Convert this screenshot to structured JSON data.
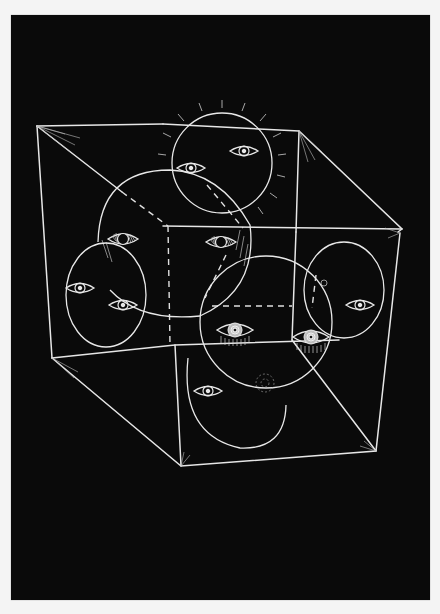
{
  "artwork": {
    "title": "Cube of Eyes",
    "medium": "white ink on black paper",
    "colors": {
      "background": "#f4f4f4",
      "paper": "#0a0a0a",
      "ink": "#e8e8e8"
    },
    "subject": {
      "cube": "wireframe cube in perspective with radiating hatch marks at vertices",
      "spheres": [
        {
          "name": "top-sphere",
          "eyes": 2,
          "rays": true
        },
        {
          "name": "upper-left-sphere",
          "eyes": 2
        },
        {
          "name": "left-sphere",
          "eyes": 2
        },
        {
          "name": "center-sphere",
          "eyes": 2
        },
        {
          "name": "right-sphere",
          "eyes": 2
        },
        {
          "name": "bottom-sphere",
          "eyes": 1
        }
      ]
    }
  }
}
